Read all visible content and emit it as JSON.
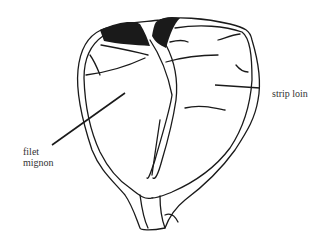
{
  "diagram": {
    "labels": {
      "strip_loin": "strip loin",
      "filet_line1": "filet",
      "filet_line2": "mignon"
    },
    "colors": {
      "line": "#1a1a1a",
      "background": "#ffffff"
    }
  }
}
